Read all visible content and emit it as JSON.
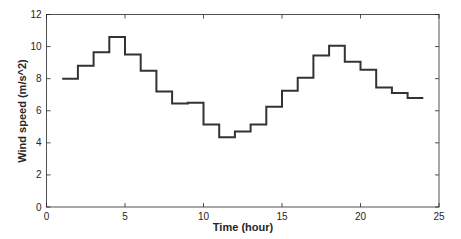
{
  "chart_data": {
    "type": "line",
    "style": "step",
    "title": "",
    "xlabel": "Time (hour)",
    "ylabel": "Wind speed (m/s^2)",
    "xlim": [
      0,
      25
    ],
    "ylim": [
      0,
      12
    ],
    "xticks": [
      0,
      5,
      10,
      15,
      20,
      25
    ],
    "yticks": [
      0,
      2,
      4,
      6,
      8,
      10,
      12
    ],
    "grid": false,
    "box": true,
    "line_color": "#333333",
    "series": [
      {
        "name": "Wind speed",
        "x": [
          1,
          2,
          3,
          4,
          5,
          6,
          7,
          8,
          9,
          10,
          11,
          12,
          13,
          14,
          15,
          16,
          17,
          18,
          19,
          20,
          21,
          22,
          23,
          24
        ],
        "values": [
          8.0,
          8.8,
          9.65,
          10.6,
          9.5,
          8.5,
          7.2,
          6.45,
          6.5,
          5.15,
          4.35,
          4.7,
          5.15,
          6.25,
          7.25,
          8.05,
          9.45,
          10.05,
          9.05,
          8.55,
          7.45,
          7.1,
          6.8,
          6.8
        ]
      }
    ]
  }
}
